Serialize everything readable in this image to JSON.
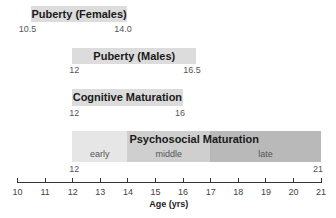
{
  "chart_data": {
    "type": "bar",
    "subtype": "horizontal-range",
    "title": "",
    "xlabel": "Age (yrs)",
    "ylabel": "",
    "xlim": [
      10,
      21
    ],
    "xticks": [
      10,
      11,
      12,
      13,
      14,
      15,
      16,
      17,
      18,
      19,
      20,
      21
    ],
    "grid": false,
    "legend": null,
    "series": [
      {
        "name": "Puberty (Females)",
        "start": 10.5,
        "end": 14.0,
        "start_label": "10.5",
        "end_label": "14.0"
      },
      {
        "name": "Puberty (Males)",
        "start": 12,
        "end": 16.5,
        "start_label": "12",
        "end_label": "16.5"
      },
      {
        "name": "Cognitive Maturation",
        "start": 12,
        "end": 16,
        "start_label": "12",
        "end_label": "16"
      },
      {
        "name": "Psychosocial Maturation",
        "start": 12,
        "end": 21,
        "start_label": "12",
        "end_label": "21",
        "segments": [
          {
            "label": "early",
            "start": 12,
            "end": 14,
            "color": "#e6e6e6"
          },
          {
            "label": "middle",
            "start": 14,
            "end": 17,
            "color": "#cfcfcf"
          },
          {
            "label": "late",
            "start": 17,
            "end": 21,
            "color": "#b9b9b9"
          }
        ]
      }
    ],
    "colors": {
      "bar": "#dcdcdc",
      "axis": "#333333"
    }
  }
}
